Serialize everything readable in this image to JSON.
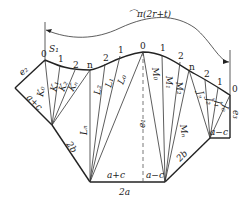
{
  "diagram": {
    "type": "sheet-metal-development-triangulation",
    "dimension_top": "⌒π(2r+t)",
    "start_label": "S₁",
    "curve_points_labels": [
      "0",
      "1",
      "2",
      "n",
      "2",
      "1",
      "0",
      "1",
      "2",
      "n",
      "2",
      "1",
      "0"
    ],
    "left_group_lines": [
      "K₀",
      "K₁",
      "K₂",
      "Kₙ"
    ],
    "middle_left_lines": [
      "Lₙ",
      "L₂",
      "L₁",
      "L₀"
    ],
    "middle_right_lines": [
      "M₀",
      "M₁",
      "M₂",
      "Mₙ"
    ],
    "right_group_lines": [
      "Jₙ",
      "J₂",
      "J₁",
      "J₀"
    ],
    "edge_labels": {
      "e1": "e₁",
      "e2": "e₂",
      "e3": "e₃",
      "left_upper": "a+c",
      "left_lower": "2b",
      "bottom_left": "a+c",
      "bottom_right": "a−c",
      "bottom_total": "2a",
      "right_lower": "2b",
      "right_short": "a−c"
    }
  }
}
